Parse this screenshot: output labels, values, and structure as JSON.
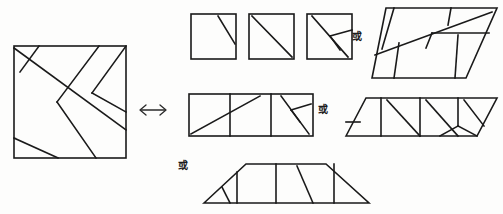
{
  "page": {
    "width": 503,
    "height": 214,
    "background_color": "#fdfdfc",
    "ink_color": "#1a1a1a",
    "header_text": ""
  },
  "labels": {
    "or_1": "或",
    "or_2": "或",
    "or_3": "或",
    "equivalence_arrow": "⟺"
  },
  "figures": {
    "source_square": {
      "name": "dissected-square",
      "shape": "square",
      "x": 14,
      "y": 46,
      "size": 112,
      "piece_count": 5
    },
    "small_squares": [
      {
        "name": "small-square-1",
        "x": 191,
        "y": 14,
        "size": 45,
        "cut": "short-diagonal-top-right"
      },
      {
        "name": "small-square-2",
        "x": 249,
        "y": 14,
        "size": 45,
        "cut": "full-diagonal"
      },
      {
        "name": "small-square-3",
        "x": 307,
        "y": 14,
        "size": 45,
        "cut": "diagonal-plus-wedge"
      }
    ],
    "parallelogram_top": {
      "name": "dissected-parallelogram",
      "shape": "parallelogram"
    },
    "rectangle_middle": {
      "name": "dissected-rectangle",
      "shape": "rectangle",
      "x": 189,
      "y": 94,
      "width": 124,
      "height": 42,
      "cells": 3
    },
    "slanted_band": {
      "name": "dissected-slanted-band",
      "shape": "oblique-hexagon"
    },
    "trapezoid_bottom": {
      "name": "dissected-trapezoid",
      "shape": "trapezoid"
    }
  },
  "watermarks": {
    "bottom": ""
  }
}
